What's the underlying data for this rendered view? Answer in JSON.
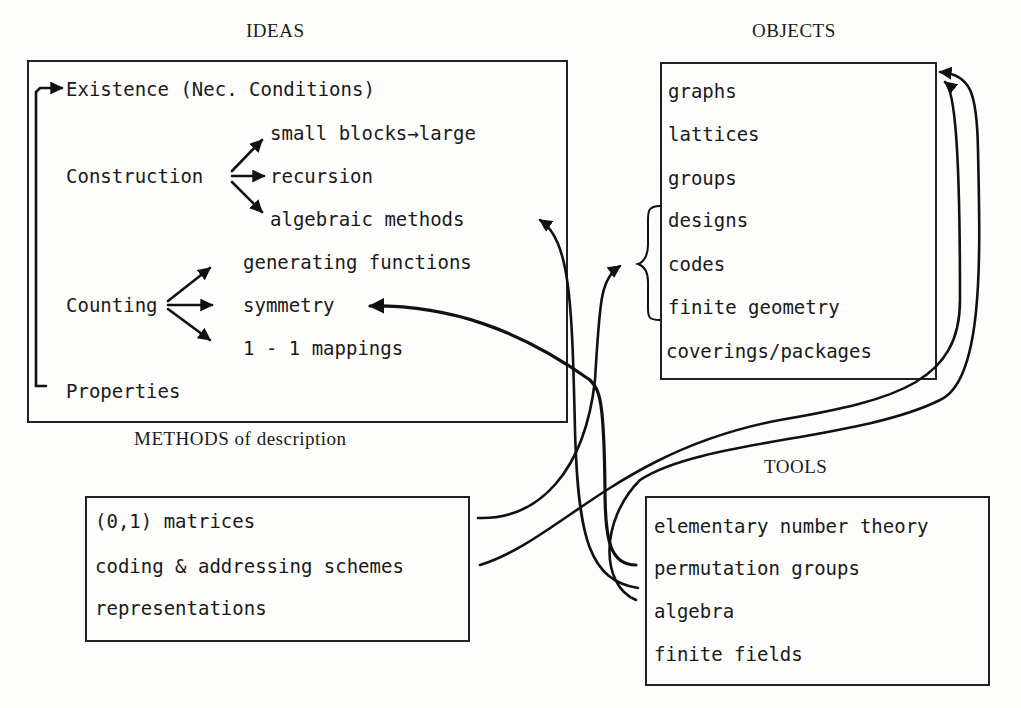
{
  "ideas": {
    "title": "IDEAS",
    "existence": "Existence  (Nec. Conditions)",
    "construction": "Construction",
    "construction_items": [
      "small blocks→large",
      "recursion",
      "algebraic methods"
    ],
    "counting": "Counting",
    "counting_items": [
      "generating functions",
      "symmetry",
      "1 - 1  mappings"
    ],
    "properties": "Properties"
  },
  "objects": {
    "title": "OBJECTS",
    "items": [
      "graphs",
      "lattices",
      "groups",
      "designs",
      "codes",
      "finite geometry",
      "coverings/packages"
    ]
  },
  "methods": {
    "title": "METHODS of description",
    "items": [
      "(0,1)  matrices",
      "coding & addressing schemes",
      "representations"
    ]
  },
  "tools": {
    "title": "TOOLS",
    "items": [
      "elementary number theory",
      "permutation groups",
      "algebra",
      "finite fields"
    ]
  }
}
